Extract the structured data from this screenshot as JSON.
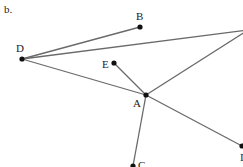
{
  "figure_label": "b.",
  "colors": {
    "line": "#6a6a6a",
    "point": "#111111",
    "text": "#222222"
  },
  "points": [
    {
      "id": "D",
      "label": "D",
      "x": 22,
      "y": 59,
      "lx": 16,
      "ly": 43
    },
    {
      "id": "B",
      "label": "B",
      "x": 140,
      "y": 27,
      "lx": 136,
      "y2": 0,
      "ly": 11
    },
    {
      "id": "A",
      "label": "A",
      "x": 146,
      "y": 95,
      "lx": 133,
      "ly": 98
    },
    {
      "id": "E",
      "label": "E",
      "x": 114,
      "y": 63,
      "lx": 102,
      "ly": 59
    },
    {
      "id": "C",
      "label": "C",
      "x": 133,
      "y": 166,
      "lx": 138,
      "ly": 160
    },
    {
      "id": "F",
      "label": "I",
      "x": 242,
      "y": 146,
      "lx": 240,
      "ly": 152
    }
  ],
  "segments": [
    {
      "from": "D",
      "to": "B"
    },
    {
      "from": "D",
      "to": "TR"
    },
    {
      "from": "D",
      "to": "A"
    },
    {
      "from": "A",
      "to": "TR"
    },
    {
      "from": "A",
      "to": "E"
    },
    {
      "from": "A",
      "to": "C"
    },
    {
      "from": "A",
      "to": "F"
    }
  ],
  "offscreen": {
    "TR": {
      "x": 248,
      "y": 30
    }
  }
}
